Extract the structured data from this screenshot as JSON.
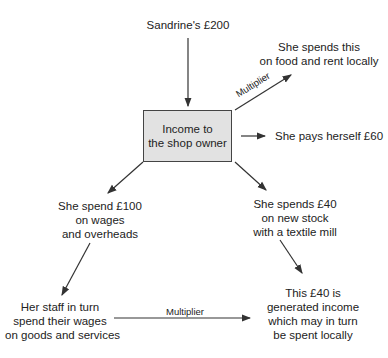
{
  "diagram": {
    "source": "Sandrine's £200",
    "center_box": [
      "Income to",
      "the shop owner"
    ],
    "top_right": [
      "She spends this",
      "on food and rent locally"
    ],
    "right": "She pays herself £60",
    "left": [
      "She spend £100",
      "on wages",
      "and overheads"
    ],
    "mid_right": [
      "She spends £40",
      "on new stock",
      "with a textile mill"
    ],
    "bottom_left": [
      "Her staff in turn",
      "spend their wages",
      "on goods and services"
    ],
    "bottom_right": [
      "This £40 is",
      "generated income",
      "which may in turn",
      "be spent locally"
    ],
    "multiplier_label": "Multiplier",
    "colors": {
      "box_fill": "#e2e2e2",
      "line": "#333333"
    }
  }
}
